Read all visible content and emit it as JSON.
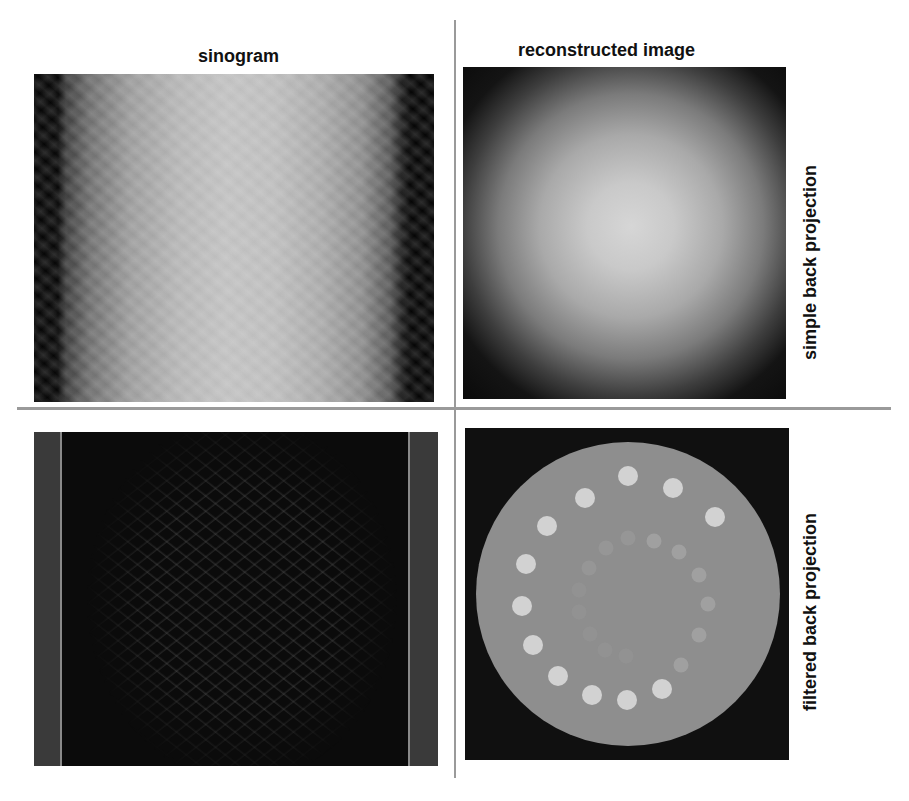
{
  "figure": {
    "column_titles": {
      "left": "sinogram",
      "right": "reconstructed image"
    },
    "row_labels": {
      "top": "simple back projection",
      "bottom": "filtered back projection"
    },
    "panels": [
      {
        "id": "sinogram",
        "row": "simple back projection",
        "column": "sinogram",
        "description": "raw sinogram, bright central band with diagonal stripe pattern, dark edges"
      },
      {
        "id": "simple-bp",
        "row": "simple back projection",
        "column": "reconstructed image",
        "description": "blurred radial glow, bright center fading to black corners"
      },
      {
        "id": "filtered-sinogram",
        "row": "filtered back projection",
        "column": "sinogram",
        "description": "high-pass filtered sinogram, dark with faint crossing sinusoidal lines, grey vertical edge bands"
      },
      {
        "id": "filtered-bp",
        "row": "filtered back projection",
        "column": "reconstructed image",
        "description": "sharp phantom: grey disk with outer ring of bright dots and inner ring of faint dots on black background"
      }
    ],
    "phantom": {
      "outer_ring_dots": 17,
      "inner_ring_dots": 14
    }
  }
}
